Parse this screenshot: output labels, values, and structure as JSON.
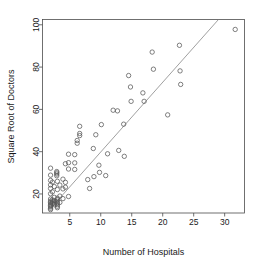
{
  "chart_data": {
    "type": "scatter",
    "title": "",
    "xlabel": "Number of Hospitals",
    "ylabel": "Square Root of Doctors",
    "xlim": [
      0.6,
      33.2
    ],
    "ylim": [
      11.0,
      102.5
    ],
    "xticks": [
      5,
      10,
      15,
      20,
      25,
      30
    ],
    "yticks": [
      20,
      40,
      60,
      80,
      100
    ],
    "xtick_labels": [
      "5",
      "10",
      "15",
      "20",
      "25",
      "30"
    ],
    "ytick_labels": [
      "20",
      "40",
      "60",
      "80",
      "100"
    ],
    "grid": false,
    "legend": null,
    "marker": "open-circle",
    "marker_color": "#555555",
    "point_count": 86,
    "points": [
      [
        1.9,
        32.2
      ],
      [
        1.9,
        28.9
      ],
      [
        1.9,
        26.4
      ],
      [
        1.9,
        24.3
      ],
      [
        1.9,
        22.6
      ],
      [
        1.9,
        20.1
      ],
      [
        1.9,
        17.6
      ],
      [
        1.9,
        16.6
      ],
      [
        1.9,
        15.9
      ],
      [
        1.9,
        15.2
      ],
      [
        1.9,
        14.6
      ],
      [
        1.9,
        13.9
      ],
      [
        1.9,
        13.2
      ],
      [
        1.9,
        12.6
      ],
      [
        2.2,
        25.6
      ],
      [
        2.2,
        21.0
      ],
      [
        2.2,
        17.2
      ],
      [
        2.2,
        16.2
      ],
      [
        2.2,
        15.4
      ],
      [
        2.5,
        23.5
      ],
      [
        2.5,
        18.4
      ],
      [
        2.5,
        16.8
      ],
      [
        2.5,
        15.7
      ],
      [
        2.5,
        14.9
      ],
      [
        2.9,
        30.6
      ],
      [
        2.9,
        30.0
      ],
      [
        2.9,
        29.4
      ],
      [
        2.9,
        28.6
      ],
      [
        3.0,
        26.0
      ],
      [
        3.0,
        22.1
      ],
      [
        3.0,
        18.0
      ],
      [
        3.0,
        17.3
      ],
      [
        3.0,
        16.5
      ],
      [
        3.0,
        15.8
      ],
      [
        3.0,
        15.0
      ],
      [
        3.0,
        14.2
      ],
      [
        3.0,
        13.5
      ],
      [
        3.4,
        24.2
      ],
      [
        3.4,
        19.0
      ],
      [
        3.4,
        16.0
      ],
      [
        3.9,
        27.0
      ],
      [
        3.9,
        22.4
      ],
      [
        3.9,
        17.8
      ],
      [
        4.3,
        34.3
      ],
      [
        4.3,
        25.5
      ],
      [
        4.3,
        23.2
      ],
      [
        4.8,
        38.8
      ],
      [
        4.8,
        34.8
      ],
      [
        4.8,
        31.8
      ],
      [
        4.8,
        18.8
      ],
      [
        5.8,
        38.6
      ],
      [
        5.8,
        34.7
      ],
      [
        5.8,
        31.6
      ],
      [
        6.2,
        45.3
      ],
      [
        6.2,
        44.0
      ],
      [
        6.6,
        52.0
      ],
      [
        6.6,
        48.6
      ],
      [
        6.6,
        47.6
      ],
      [
        7.9,
        26.8
      ],
      [
        8.2,
        22.6
      ],
      [
        8.8,
        41.5
      ],
      [
        8.9,
        28.2
      ],
      [
        9.2,
        48.0
      ],
      [
        9.7,
        33.6
      ],
      [
        9.8,
        30.2
      ],
      [
        10.1,
        52.8
      ],
      [
        10.8,
        28.7
      ],
      [
        11.1,
        39.0
      ],
      [
        12.0,
        59.6
      ],
      [
        12.7,
        59.3
      ],
      [
        12.9,
        40.6
      ],
      [
        13.7,
        53.0
      ],
      [
        13.8,
        37.8
      ],
      [
        14.5,
        76.0
      ],
      [
        14.8,
        70.6
      ],
      [
        14.9,
        63.8
      ],
      [
        16.8,
        67.8
      ],
      [
        17.0,
        63.8
      ],
      [
        18.3,
        87.1
      ],
      [
        18.5,
        79.0
      ],
      [
        20.8,
        57.4
      ],
      [
        22.7,
        90.3
      ],
      [
        22.8,
        78.2
      ],
      [
        22.9,
        71.8
      ],
      [
        31.7,
        97.8
      ]
    ],
    "fit_line": {
      "label": "least-squares fit",
      "color": "#777777",
      "x_start": 1.8,
      "y_start": 12.8,
      "x_end": 29.0,
      "y_end": 102.5
    }
  }
}
